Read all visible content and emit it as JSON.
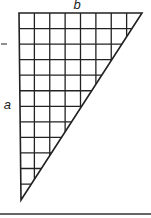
{
  "figure": {
    "label_top": "b",
    "label_left": "a",
    "grid_columns": 8,
    "grid_rows": 12,
    "shape": "right triangle with grid, right angle at top-left",
    "line_color": "#222222",
    "background": "#ffffff"
  }
}
